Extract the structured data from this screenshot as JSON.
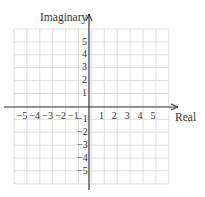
{
  "diagram": {
    "type": "complex-plane",
    "x_axis": {
      "label": "Real",
      "min": -5,
      "max": 5,
      "ticks": [
        "-5",
        "-4",
        "-3",
        "-2",
        "-1",
        "1",
        "2",
        "3",
        "4",
        "5"
      ]
    },
    "y_axis": {
      "label": "Imaginary",
      "min": -5,
      "max": 5,
      "ticks": [
        "5",
        "4",
        "3",
        "2",
        "1",
        "-1",
        "-2",
        "-3",
        "-4",
        "-5"
      ]
    },
    "grid": {
      "columns": 12,
      "rows": 12,
      "color": "#d6d6d6"
    },
    "axis_color": "#333333"
  }
}
